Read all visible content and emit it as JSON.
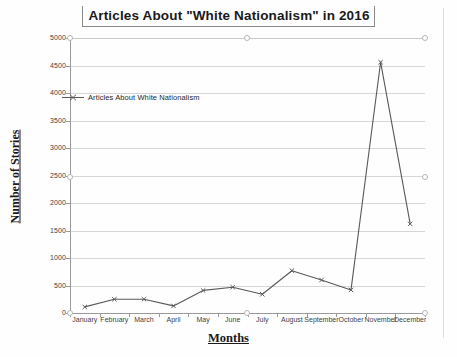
{
  "chart_data": {
    "type": "line",
    "title": "Articles About \"White Nationalism\" in 2016",
    "xlabel": "Months",
    "ylabel": "Number of Stories",
    "categories": [
      "January",
      "February",
      "March",
      "April",
      "May",
      "June",
      "July",
      "August",
      "September",
      "October",
      "November",
      "December"
    ],
    "series": [
      {
        "name": "Articles About White Nationalism",
        "values": [
          110,
          250,
          250,
          130,
          410,
          470,
          340,
          770,
          600,
          420,
          4560,
          1620
        ]
      }
    ],
    "ylim": [
      0,
      5000
    ],
    "ytick_labels": [
      "0",
      "500",
      "1000",
      "1500",
      "2000",
      "2500",
      "3000",
      "3500",
      "4000",
      "4500",
      "5000"
    ],
    "ytick_values": [
      0,
      500,
      1000,
      1500,
      2000,
      2500,
      3000,
      3500,
      4000,
      4500,
      5000
    ],
    "grid": true,
    "legend_position": "inside-top-left",
    "line_color": "#595959",
    "marker": "x-cross"
  },
  "legend": {
    "entry_label": "Articles About White Nationalism",
    "symbol_name": "line-with-marker-icon"
  },
  "selection_handles": {
    "present": true,
    "count": 6
  }
}
